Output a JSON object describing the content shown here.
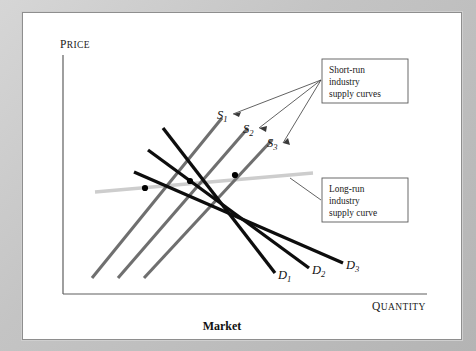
{
  "figure": {
    "title": "Market",
    "axes": {
      "y_label": "Price",
      "x_label": "Quantity"
    }
  },
  "callouts": [
    {
      "id": "short-run",
      "lines": [
        "Short-run",
        "industry",
        "supply curves"
      ],
      "box": {
        "x": 300,
        "y": 47,
        "w": 86,
        "h": 44
      }
    },
    {
      "id": "long-run",
      "lines": [
        "Long-run",
        "industry",
        "supply curve"
      ],
      "box": {
        "x": 300,
        "y": 166,
        "w": 86,
        "h": 44
      }
    }
  ],
  "curve_labels": {
    "supply": [
      {
        "base": "S",
        "sub": "1",
        "x": 195,
        "y": 107
      },
      {
        "base": "S",
        "sub": "2",
        "x": 221,
        "y": 121
      },
      {
        "base": "S",
        "sub": "3",
        "x": 245,
        "y": 135
      }
    ],
    "demand": [
      {
        "base": "D",
        "sub": "1",
        "x": 256,
        "y": 267
      },
      {
        "base": "D",
        "sub": "2",
        "x": 290,
        "y": 262
      },
      {
        "base": "D",
        "sub": "3",
        "x": 324,
        "y": 257
      }
    ]
  },
  "chart_data": {
    "type": "line",
    "title": "Market",
    "xlabel": "Quantity",
    "ylabel": "Price",
    "grid": false,
    "legend": "annotations",
    "axis_origin_px": {
      "x": 41,
      "y": 282
    },
    "axis_end_px": {
      "x": 405,
      "y": 282,
      "y_top": 43
    },
    "series": [
      {
        "name": "S1",
        "role": "short-run industry supply curve",
        "color": "#6f6f6f",
        "slope": "upward",
        "points_px": [
          [
            70,
            266
          ],
          [
            200,
            106
          ]
        ]
      },
      {
        "name": "S2",
        "role": "short-run industry supply curve",
        "color": "#6f6f6f",
        "slope": "upward",
        "points_px": [
          [
            96,
            266
          ],
          [
            226,
            116
          ]
        ]
      },
      {
        "name": "S3",
        "role": "short-run industry supply curve",
        "color": "#6f6f6f",
        "slope": "upward",
        "points_px": [
          [
            122,
            266
          ],
          [
            250,
            128
          ]
        ]
      },
      {
        "name": "D1",
        "role": "demand curve",
        "color": "#0d0d0d",
        "slope": "downward",
        "points_px": [
          [
            141,
            116
          ],
          [
            253,
            261
          ]
        ]
      },
      {
        "name": "D2",
        "role": "demand curve",
        "color": "#0d0d0d",
        "slope": "downward",
        "points_px": [
          [
            126,
            138
          ],
          [
            287,
            256
          ]
        ]
      },
      {
        "name": "D3",
        "role": "demand curve",
        "color": "#0d0d0d",
        "slope": "downward",
        "points_px": [
          [
            112,
            160
          ],
          [
            321,
            251
          ]
        ]
      },
      {
        "name": "LRS",
        "role": "long-run industry supply curve",
        "color": "#cdcdcd",
        "slope": "slightly upward",
        "points_px": [
          [
            73,
            180
          ],
          [
            291,
            161
          ]
        ]
      }
    ],
    "equilibria_px": [
      [
        123,
        176
      ],
      [
        168,
        169
      ],
      [
        213,
        163
      ]
    ],
    "notes": [
      "Three short-run supply curves shift right as demand increases.",
      "Three demand curves shift right.",
      "Long-run industry supply curve connects the three equilibrium points."
    ]
  }
}
